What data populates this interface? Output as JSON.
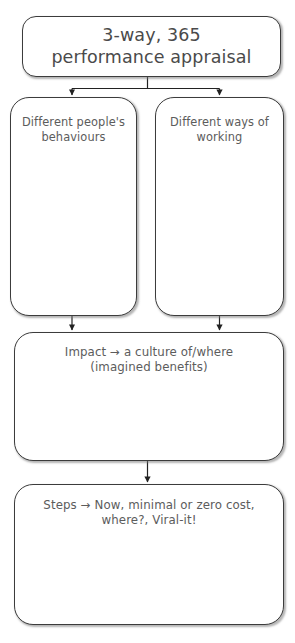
{
  "diagram": {
    "background_color": "#ffffff",
    "text_color": "#5c5c5c",
    "border_color": "#3c3c3c",
    "connector_color": "#222222",
    "nodes": {
      "title": {
        "text": "3-way, 365\nperformance appraisal"
      },
      "behaviours": {
        "text": "Different people's\nbehaviours"
      },
      "ways": {
        "text": "Different ways of\nworking"
      },
      "impact": {
        "text": "Impact → a culture of/where\n(imagined benefits)"
      },
      "steps": {
        "text": "Steps → Now, minimal or zero cost,\nwhere?, Viral-it!"
      }
    },
    "connectors": [
      {
        "name": "title-to-behaviours",
        "type": "split-arrow"
      },
      {
        "name": "title-to-ways",
        "type": "split-arrow"
      },
      {
        "name": "behaviours-to-impact",
        "type": "arrow"
      },
      {
        "name": "ways-to-impact",
        "type": "arrow"
      },
      {
        "name": "impact-to-steps",
        "type": "arrow"
      }
    ]
  }
}
